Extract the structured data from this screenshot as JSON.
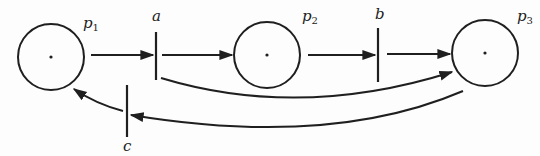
{
  "diagram": {
    "type": "petri-net",
    "places": [
      {
        "id": "p1",
        "label": "p",
        "subscript": "1",
        "cx": 51,
        "cy": 57,
        "r": 33,
        "tokens": 1
      },
      {
        "id": "p2",
        "label": "p",
        "subscript": "2",
        "cx": 267,
        "cy": 55,
        "r": 33,
        "tokens": 1
      },
      {
        "id": "p3",
        "label": "p",
        "subscript": "3",
        "cx": 485,
        "cy": 53,
        "r": 33,
        "tokens": 1
      }
    ],
    "transitions": [
      {
        "id": "a",
        "label": "a",
        "x": 156,
        "y1": 32,
        "y2": 80
      },
      {
        "id": "b",
        "label": "b",
        "x": 378,
        "y1": 28,
        "y2": 82
      },
      {
        "id": "c",
        "label": "c",
        "x": 127,
        "y1": 85,
        "y2": 137
      }
    ],
    "arcs": [
      {
        "from": "p1",
        "to": "a"
      },
      {
        "from": "a",
        "to": "p2"
      },
      {
        "from": "p2",
        "to": "b"
      },
      {
        "from": "b",
        "to": "p3"
      },
      {
        "from": "a",
        "to": "p3"
      },
      {
        "from": "p3",
        "to": "c"
      },
      {
        "from": "c",
        "to": "p1"
      }
    ]
  }
}
